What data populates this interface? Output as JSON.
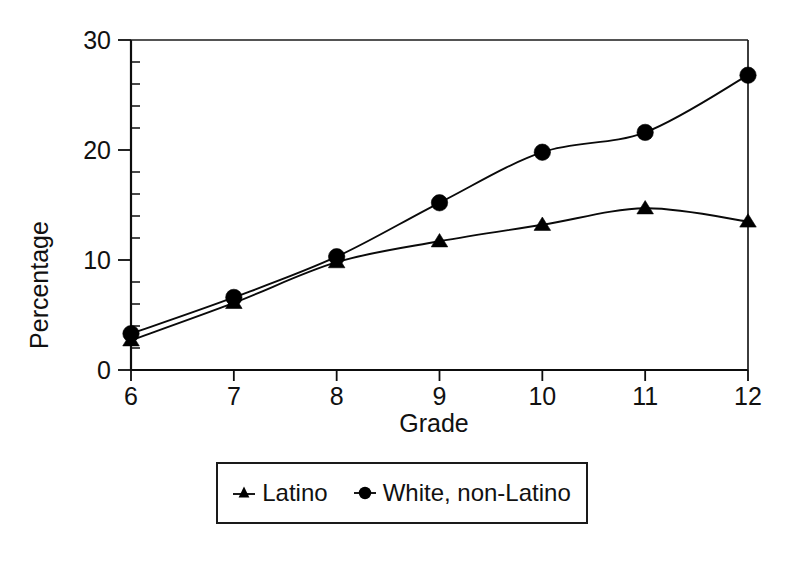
{
  "chart_data": {
    "type": "line",
    "title": "",
    "subtitle": "",
    "xlabel": "Grade",
    "ylabel": "Percentage",
    "x": [
      6,
      7,
      8,
      9,
      10,
      11,
      12
    ],
    "categories": [
      "6",
      "7",
      "8",
      "9",
      "10",
      "11",
      "12"
    ],
    "xtick_labels": [
      "6",
      "7",
      "8",
      "9",
      "10",
      "11",
      "12"
    ],
    "ytick_labels": [
      "0",
      "10",
      "20",
      "30"
    ],
    "yticks": [
      0,
      10,
      20,
      30
    ],
    "xlim": [
      6,
      12
    ],
    "ylim": [
      0,
      30
    ],
    "y_minor_tick_interval": 2,
    "grid": false,
    "legend_position": "bottom",
    "series": [
      {
        "name": "Latino",
        "marker": "triangle",
        "color": "#000000",
        "values": [
          2.7,
          6.1,
          9.8,
          11.7,
          13.2,
          14.7,
          13.5
        ]
      },
      {
        "name": "White, non-Latino",
        "marker": "circle",
        "color": "#000000",
        "values": [
          3.3,
          6.6,
          10.3,
          15.2,
          19.8,
          21.6,
          26.8
        ]
      }
    ]
  },
  "axes": {
    "y_title": "Percentage",
    "x_title": "Grade"
  },
  "legend": {
    "entries": [
      {
        "label": "Latino",
        "marker": "triangle"
      },
      {
        "label": "White, non-Latino",
        "marker": "circle"
      }
    ]
  }
}
